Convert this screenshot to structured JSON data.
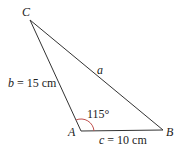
{
  "diagram": {
    "type": "triangle",
    "vertices": [
      {
        "label": "A",
        "x": 81,
        "y": 131
      },
      {
        "label": "B",
        "x": 163,
        "y": 130
      },
      {
        "label": "C",
        "x": 30,
        "y": 20
      }
    ],
    "sides": {
      "a": {
        "var": "a",
        "value": ""
      },
      "b": {
        "var": "b",
        "value": " = 15 cm"
      },
      "c": {
        "var": "c",
        "value": " = 10 cm"
      }
    },
    "angle_A": {
      "label": "115°",
      "arc_color": "#c0504d"
    },
    "line_color": "#333333"
  }
}
